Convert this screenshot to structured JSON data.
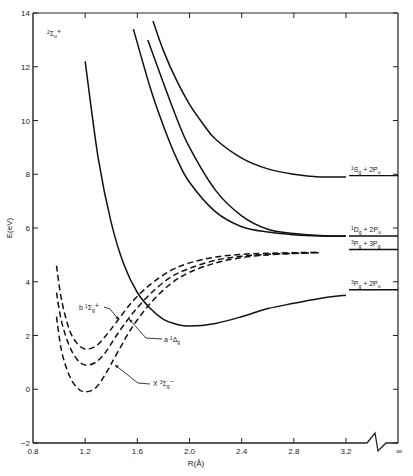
{
  "chart_data": {
    "type": "line",
    "title": "",
    "state_label": {
      "main": "2",
      "sym": "Σ",
      "sub": "u",
      "sup": "+"
    },
    "xlabel": "R(Å)",
    "ylabel": "E(eV)",
    "xlim": [
      0.8,
      3.2
    ],
    "ylim": [
      -2,
      14
    ],
    "x_break": true,
    "x_ticks": [
      "0.8",
      "1.2",
      "1.6",
      "2.0",
      "2.4",
      "2.8",
      "3.2"
    ],
    "x_tick_values": [
      0.8,
      1.2,
      1.6,
      2.0,
      2.4,
      2.8,
      3.2
    ],
    "x_infinity_label": "∞",
    "y_ticks": [
      "14",
      "12",
      "10",
      "8",
      "6",
      "4",
      "2",
      "0",
      "−2"
    ],
    "y_tick_values": [
      14,
      12,
      10,
      8,
      6,
      4,
      2,
      0,
      -2
    ],
    "grid": false,
    "series": [
      {
        "name": "2Σu+ state A",
        "style": "solid",
        "x": [
          1.2,
          1.3,
          1.4,
          1.5,
          1.6,
          1.7,
          1.8,
          1.9,
          2.0,
          2.2,
          2.4,
          2.6,
          2.8,
          3.0,
          3.2
        ],
        "y": [
          12.2,
          8.6,
          6.2,
          4.6,
          3.6,
          3.0,
          2.6,
          2.42,
          2.35,
          2.45,
          2.7,
          3.0,
          3.2,
          3.38,
          3.5
        ]
      },
      {
        "name": "2Σu+ state B",
        "style": "solid",
        "x": [
          1.57,
          1.7,
          1.8,
          1.9,
          2.0,
          2.2,
          2.4,
          2.6,
          2.8,
          3.0,
          3.2
        ],
        "y": [
          13.4,
          11.2,
          9.8,
          8.6,
          7.7,
          6.6,
          6.05,
          5.85,
          5.75,
          5.7,
          5.7
        ]
      },
      {
        "name": "2Σu+ state C",
        "style": "solid",
        "x": [
          1.68,
          1.8,
          1.9,
          2.0,
          2.2,
          2.4,
          2.6,
          2.8,
          3.0,
          3.2
        ],
        "y": [
          13.0,
          11.4,
          10.1,
          9.0,
          7.4,
          6.45,
          5.95,
          5.8,
          5.72,
          5.7
        ]
      },
      {
        "name": "2Σu+ state D",
        "style": "solid",
        "x": [
          1.72,
          1.8,
          1.9,
          2.0,
          2.1,
          2.2,
          2.4,
          2.6,
          2.8,
          3.0,
          3.2
        ],
        "y": [
          13.7,
          12.6,
          11.5,
          10.6,
          9.9,
          9.3,
          8.6,
          8.2,
          8.0,
          7.9,
          7.9
        ]
      },
      {
        "name": "X 3Σg−",
        "style": "dashed",
        "x": [
          0.98,
          1.02,
          1.08,
          1.14,
          1.2,
          1.28,
          1.36,
          1.44,
          1.56,
          1.7,
          1.85,
          2.0,
          2.2,
          2.4,
          2.6,
          2.8,
          2.95
        ],
        "y": [
          2.7,
          1.4,
          0.5,
          0.05,
          -0.1,
          0.05,
          0.6,
          1.3,
          2.3,
          3.2,
          3.9,
          4.35,
          4.7,
          4.9,
          5.0,
          5.05,
          5.08
        ]
      },
      {
        "name": "a 1Δg",
        "style": "dashed",
        "x": [
          0.98,
          1.02,
          1.08,
          1.14,
          1.2,
          1.28,
          1.36,
          1.44,
          1.56,
          1.7,
          1.85,
          2.0,
          2.2,
          2.4,
          2.6,
          2.8,
          3.0
        ],
        "y": [
          3.6,
          2.5,
          1.6,
          1.1,
          0.9,
          1.0,
          1.4,
          2.0,
          2.8,
          3.55,
          4.15,
          4.5,
          4.8,
          4.95,
          5.02,
          5.06,
          5.08
        ]
      },
      {
        "name": "b 1Σg+",
        "style": "dashed",
        "x": [
          0.98,
          1.02,
          1.08,
          1.14,
          1.2,
          1.28,
          1.36,
          1.44,
          1.56,
          1.7,
          1.85,
          2.0,
          2.2,
          2.4,
          2.6,
          2.8,
          3.0
        ],
        "y": [
          4.6,
          3.3,
          2.2,
          1.7,
          1.5,
          1.6,
          2.0,
          2.5,
          3.25,
          3.9,
          4.4,
          4.7,
          4.92,
          5.02,
          5.06,
          5.08,
          5.1
        ]
      }
    ],
    "asymptotes": [
      {
        "label_parts": [
          "1",
          "S",
          "g",
          " + 2",
          "P",
          "u"
        ],
        "label": "1Sg + 2Pu",
        "y": 7.95
      },
      {
        "label_parts": [
          "1",
          "D",
          "g",
          " + 2",
          "P",
          "u"
        ],
        "label": "1Dg + 2Pu",
        "y": 5.7
      },
      {
        "label_parts": [
          "3",
          "P",
          "g",
          " + 3",
          "P",
          "g"
        ],
        "label": "3Pg + 3Pg",
        "y": 5.2
      },
      {
        "label_parts": [
          "3",
          "P",
          "g",
          " + 2",
          "P",
          "u"
        ],
        "label": "3Pg + 2Pu",
        "y": 3.7
      }
    ],
    "annotations": [
      {
        "text_parts": [
          "b ",
          "1",
          "Σ",
          "g",
          "+"
        ],
        "label": "b 1Σg+",
        "target": "b 1Σg+"
      },
      {
        "text_parts": [
          "a ",
          "1",
          "Δ",
          "g",
          ""
        ],
        "label": "a 1Δg",
        "target": "a 1Δg"
      },
      {
        "text_parts": [
          "X ",
          "3",
          "Σ",
          "g",
          "−"
        ],
        "label": "X 3Σg−",
        "target": "X 3Σg−"
      }
    ]
  }
}
